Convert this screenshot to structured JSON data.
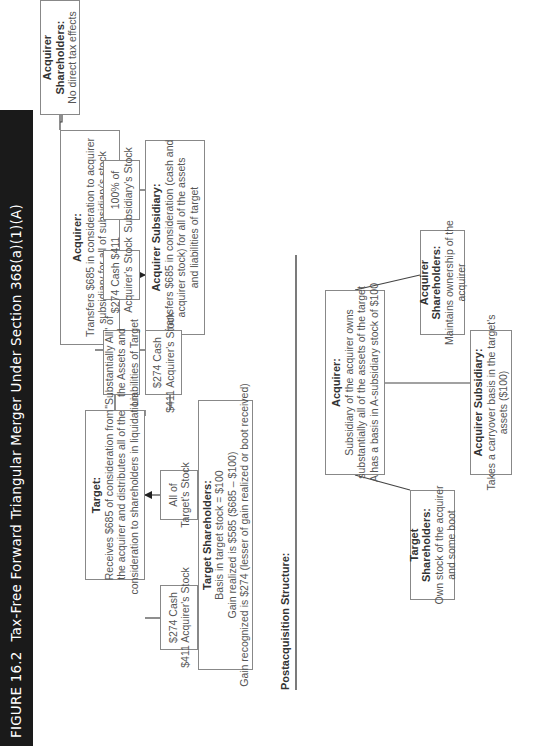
{
  "figure": {
    "number": "FIGURE 16.2",
    "title": "Tax-Free Forward Triangular Merger Under Section 368(a)(1)(A)"
  },
  "transaction": {
    "acquirer_shareholders": {
      "heading": "Acquirer Shareholders:",
      "lines": [
        "No direct tax effects"
      ]
    },
    "acquirer": {
      "heading": "Acquirer:",
      "lines": [
        "Transfers $685 in consideration to acquirer",
        "subsidiary for all of subsidiary's stock"
      ]
    },
    "flow_cash_stock_to_sub": {
      "lines": [
        "$274 Cash $411",
        "Acquirer's Stock"
      ]
    },
    "flow_sub_stock_to_acquirer": {
      "lines": [
        "100% of",
        "Subsidiary's  Stock"
      ]
    },
    "acquirer_subsidiary": {
      "heading": "Acquirer Subsidiary:",
      "lines": [
        "Transfers $685 in consideration (cash and",
        "acquirer stock) for all of the assets",
        "and liabilities of target"
      ]
    },
    "flow_assets_to_sub": {
      "lines": [
        "\"Substantially All\" of",
        "the Assets and",
        "Liabilities of Target"
      ]
    },
    "flow_cash_stock_to_target": {
      "lines": [
        "$274 Cash",
        "$411 Acquirer's Stock"
      ]
    },
    "target": {
      "heading": "Target:",
      "lines": [
        "Receives $685 of consideration from",
        "the acquirer and distributes all of the",
        "consideration to shareholders in liquidation"
      ]
    },
    "flow_target_stock": {
      "lines": [
        "All of",
        "Target's Stock"
      ]
    },
    "flow_cash_stock_to_shareholders": {
      "lines": [
        "$274 Cash",
        "$411 Acquirer's Stock"
      ]
    },
    "target_shareholders": {
      "heading": "Target Shareholders:",
      "lines": [
        "Basis in target stock = $100",
        "Gain realized is $585 ($685 – $100)",
        "Gain recognized is $274 (lesser of gain realized or boot received)"
      ]
    }
  },
  "postacquisition": {
    "label": "Postacquisition Structure:",
    "acquirer": {
      "heading": "Acquirer:",
      "lines": [
        "Subsidiary of the acquirer owns",
        "substantially all of the assets of the target",
        "A has a basis in A-subsidiary stock of $100"
      ]
    },
    "target_shareholders": {
      "heading": "Target Shareholders:",
      "lines": [
        "Own stock of the acquirer",
        "and some boot"
      ]
    },
    "acquirer_shareholders": {
      "heading": "Acquirer Shareholders:",
      "lines": [
        "Maintains ownership of the",
        "acquirer"
      ]
    },
    "acquirer_subsidiary": {
      "heading": "Acquirer Subsidiary:",
      "lines": [
        "Takes a carryover basis in the target's",
        "assets ($100)"
      ]
    }
  },
  "colors": {
    "title_bar_bg": "#1a1a1a",
    "title_bar_text": "#ffffff",
    "box_border": "#888888",
    "text": "#555555",
    "heading_text": "#333333"
  }
}
